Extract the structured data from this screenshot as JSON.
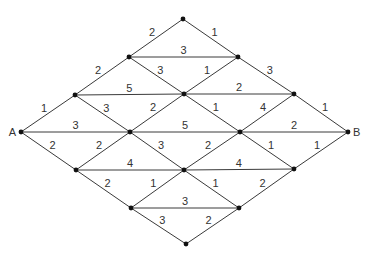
{
  "diagram": {
    "type": "weighted-lattice-graph",
    "nodes": [
      {
        "id": "T",
        "x": 183,
        "y": 19,
        "label": ""
      },
      {
        "id": "n21",
        "x": 129,
        "y": 57,
        "label": ""
      },
      {
        "id": "n22",
        "x": 238,
        "y": 57,
        "label": ""
      },
      {
        "id": "n31",
        "x": 75,
        "y": 95,
        "label": ""
      },
      {
        "id": "n32",
        "x": 184,
        "y": 94,
        "label": ""
      },
      {
        "id": "n33",
        "x": 294,
        "y": 94,
        "label": ""
      },
      {
        "id": "A",
        "x": 21,
        "y": 132,
        "label": "A"
      },
      {
        "id": "n42",
        "x": 130,
        "y": 132,
        "label": ""
      },
      {
        "id": "n43",
        "x": 240,
        "y": 132,
        "label": ""
      },
      {
        "id": "B",
        "x": 348,
        "y": 132,
        "label": "B"
      },
      {
        "id": "n51",
        "x": 76,
        "y": 170,
        "label": ""
      },
      {
        "id": "n52",
        "x": 184,
        "y": 170,
        "label": ""
      },
      {
        "id": "n53",
        "x": 294,
        "y": 169,
        "label": ""
      },
      {
        "id": "n61",
        "x": 131,
        "y": 208,
        "label": ""
      },
      {
        "id": "n62",
        "x": 239,
        "y": 208,
        "label": ""
      },
      {
        "id": "Bot",
        "x": 186,
        "y": 244,
        "label": ""
      }
    ],
    "edges": [
      {
        "from": "T",
        "to": "n21",
        "weight": "2"
      },
      {
        "from": "T",
        "to": "n22",
        "weight": "1"
      },
      {
        "from": "n21",
        "to": "n22",
        "weight": "3"
      },
      {
        "from": "n21",
        "to": "n31",
        "weight": "2"
      },
      {
        "from": "n21",
        "to": "n32",
        "weight": "3"
      },
      {
        "from": "n22",
        "to": "n32",
        "weight": "1"
      },
      {
        "from": "n22",
        "to": "n33",
        "weight": "3"
      },
      {
        "from": "n31",
        "to": "n32",
        "weight": "5"
      },
      {
        "from": "n32",
        "to": "n33",
        "weight": "2"
      },
      {
        "from": "A",
        "to": "n31",
        "weight": "1"
      },
      {
        "from": "n31",
        "to": "n42",
        "weight": "3"
      },
      {
        "from": "n32",
        "to": "n42",
        "weight": "2"
      },
      {
        "from": "n32",
        "to": "n43",
        "weight": "1"
      },
      {
        "from": "n33",
        "to": "n43",
        "weight": "4"
      },
      {
        "from": "n33",
        "to": "B",
        "weight": "1"
      },
      {
        "from": "A",
        "to": "n42",
        "weight": "3"
      },
      {
        "from": "n42",
        "to": "n43",
        "weight": "5"
      },
      {
        "from": "n43",
        "to": "B",
        "weight": "2"
      },
      {
        "from": "A",
        "to": "n51",
        "weight": "2"
      },
      {
        "from": "n42",
        "to": "n51",
        "weight": "2"
      },
      {
        "from": "n42",
        "to": "n52",
        "weight": "3"
      },
      {
        "from": "n43",
        "to": "n52",
        "weight": "2"
      },
      {
        "from": "n43",
        "to": "n53",
        "weight": "1"
      },
      {
        "from": "B",
        "to": "n53",
        "weight": "1"
      },
      {
        "from": "n51",
        "to": "n52",
        "weight": "4"
      },
      {
        "from": "n52",
        "to": "n53",
        "weight": "4"
      },
      {
        "from": "n51",
        "to": "n61",
        "weight": "2"
      },
      {
        "from": "n52",
        "to": "n61",
        "weight": "1"
      },
      {
        "from": "n52",
        "to": "n62",
        "weight": "1"
      },
      {
        "from": "n53",
        "to": "n62",
        "weight": "2"
      },
      {
        "from": "n61",
        "to": "n62",
        "weight": "3"
      },
      {
        "from": "n61",
        "to": "Bot",
        "weight": "3"
      },
      {
        "from": "n62",
        "to": "Bot",
        "weight": "2"
      }
    ],
    "colors": {
      "edge": "#3a3a3a",
      "node": "#111111",
      "text": "#333333",
      "background": "#ffffff"
    }
  }
}
